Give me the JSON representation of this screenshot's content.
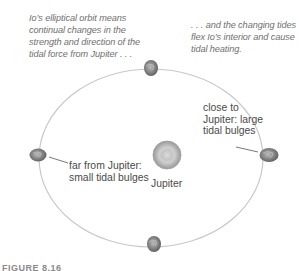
{
  "figure": {
    "annotation_left": "Io’s elliptical orbit means continual changes in the strength and direction of the tidal force from Jupiter . . .",
    "annotation_right": ". . . and the changing tides flex Io’s interior and cause tidal heating.",
    "label_far": "far from Jupiter: small tidal bulges",
    "label_close": "close to Jupiter: large tidal bulges",
    "label_planet": "Jupiter",
    "caption": "FIGURE 8.16"
  },
  "elements": {
    "orbit": "elliptical-orbit",
    "central_body": "Jupiter",
    "moon": "Io",
    "moon_positions": [
      "top",
      "left-far",
      "right-close",
      "bottom"
    ]
  },
  "colors": {
    "orbit_line": "#c8c8c8",
    "annotation_text": "#6f6f6f",
    "label_text": "#4a4a4a",
    "jupiter": "#b5b5b5",
    "moon": "#8a8a8a"
  }
}
